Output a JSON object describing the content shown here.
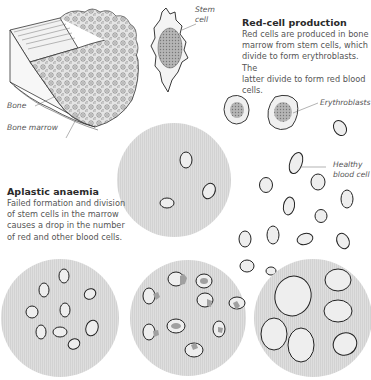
{
  "sections": {
    "red_cell_production": {
      "heading": "Red-cell production",
      "lines": [
        "Red cells are produced in bone",
        "marrow from stem cells, which",
        "divide to form erythroblasts. The",
        "latter divide to form red blood cells."
      ]
    },
    "aplastic_anaemia": {
      "heading": "Aplastic anaemia",
      "lines": [
        "Failed formation and division",
        "of stem cells in the marrow",
        "causes a drop in the number",
        "of red and other blood cells."
      ]
    }
  },
  "labels": {
    "stem_cell": [
      "Stem",
      "cell"
    ],
    "bone": "Bone",
    "bone_marrow": "Bone marrow",
    "erythroblasts": "Erythroblasts",
    "healthy_blood_cell": [
      "Healthy",
      "blood cell"
    ]
  },
  "colors": {
    "circle_fill": "#dcdcdc",
    "cell_outline": "#222222",
    "cell_fill": "#eeeeee",
    "nucleus_fill": "#a8a8a8",
    "text": "#555555",
    "heading": "#2a2a2a"
  },
  "panels": [
    {
      "name": "aplastic-marrow-sample",
      "cx": 174,
      "cy": 180,
      "r": 57
    },
    {
      "name": "normal-blood-sample",
      "cx": 60,
      "cy": 318,
      "r": 59
    },
    {
      "name": "abnormal-cells-sample",
      "cx": 188,
      "cy": 318,
      "r": 58
    },
    {
      "name": "enlarged-cells-sample",
      "cx": 313,
      "cy": 318,
      "r": 59
    }
  ]
}
